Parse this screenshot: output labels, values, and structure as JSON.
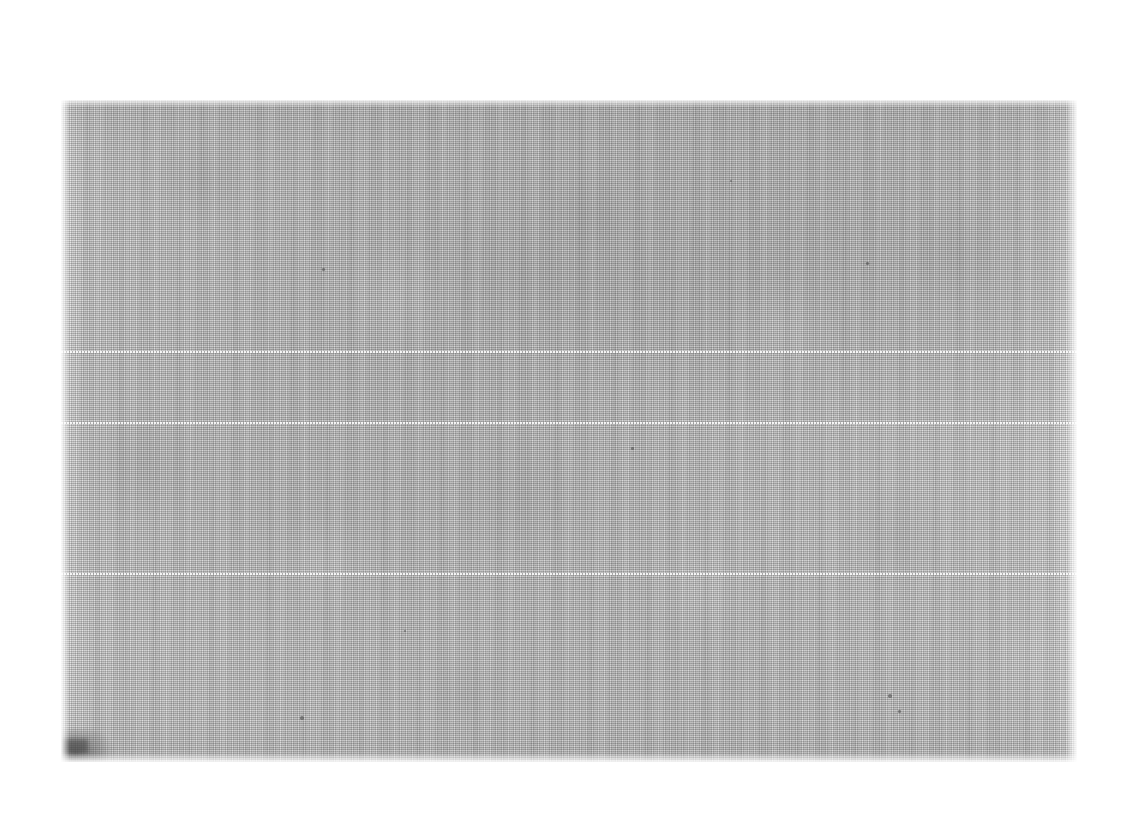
{
  "document": {
    "kind": "scanned-blank-page",
    "title": "Scanned Blank Page",
    "visible_text": "",
    "page_background_color": "#ffffff",
    "canvas": {
      "width": 1133,
      "height": 825
    }
  },
  "scan": {
    "label": "scanned-page-image",
    "description": "Blank scanned document page with halftone dot texture",
    "bounds": {
      "x": 61,
      "y": 100,
      "width": 1016,
      "height": 662
    },
    "base_color": "#d6d6d6",
    "lightest_color": "#ebebeb",
    "darkest_color": "#9a9a9a",
    "texture": "halftone-dither-dots",
    "orientation": "landscape"
  },
  "artifacts": {
    "scan_lines": [
      {
        "name": "scan-line-upper",
        "y": 351,
        "color": "#f2f2f2"
      },
      {
        "name": "scan-line-middle",
        "y": 422,
        "color": "#f2f2f2"
      },
      {
        "name": "scan-line-lower",
        "y": 573,
        "color": "#f2f2f2"
      }
    ],
    "smudge": {
      "name": "corner-smudge",
      "x": 62,
      "y": 735,
      "width": 48,
      "height": 24,
      "color": "#4a4a4a"
    },
    "specks": [
      {
        "x": 322,
        "y": 268,
        "size": 3
      },
      {
        "x": 866,
        "y": 262,
        "size": 3
      },
      {
        "x": 300,
        "y": 716,
        "size": 4
      },
      {
        "x": 888,
        "y": 694,
        "size": 4
      },
      {
        "x": 898,
        "y": 710,
        "size": 3
      },
      {
        "x": 631,
        "y": 447,
        "size": 3
      },
      {
        "x": 404,
        "y": 630,
        "size": 2
      },
      {
        "x": 730,
        "y": 180,
        "size": 2
      }
    ]
  }
}
